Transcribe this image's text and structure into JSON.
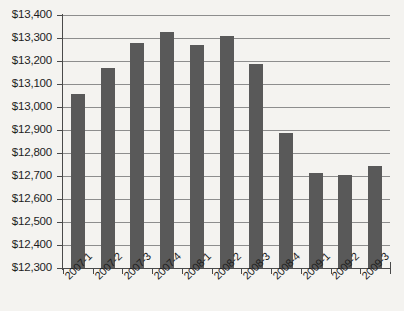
{
  "chart_data": {
    "type": "bar",
    "title": "",
    "subtitle": "",
    "xlabel": "",
    "ylabel": "",
    "categories": [
      "2007-1",
      "2007-2",
      "2007-3",
      "2007-4",
      "2008-1",
      "2008-2",
      "2008-3",
      "2008-4",
      "2009-1",
      "2009-2",
      "2009-3"
    ],
    "values": [
      13055,
      13170,
      13278,
      13325,
      13268,
      13308,
      13185,
      12885,
      12715,
      12705,
      12745
    ],
    "ylim": [
      12300,
      13400
    ],
    "ytick_values": [
      13400,
      13300,
      13200,
      13100,
      13000,
      12900,
      12800,
      12700,
      12600,
      12500,
      12400,
      12300
    ],
    "ytick_labels": [
      "$13,400",
      "$13,300",
      "$13,200",
      "$13,100",
      "$13,000",
      "$12,900",
      "$12,800",
      "$12,700",
      "$12,600",
      "$12,500",
      "$12,400",
      "$12,300"
    ],
    "grid": true,
    "legend": false,
    "legend_position": "none",
    "series": [
      {
        "name": "",
        "values": [
          13055,
          13170,
          13278,
          13325,
          13268,
          13308,
          13185,
          12885,
          12715,
          12705,
          12745
        ]
      }
    ]
  },
  "style": {
    "bar_color": "#595959",
    "gridline_color": "#8d8d8d",
    "axis_color": "#4a4a4a",
    "background_color": "#f4f3f0",
    "text_color": "#1d1d1d"
  }
}
